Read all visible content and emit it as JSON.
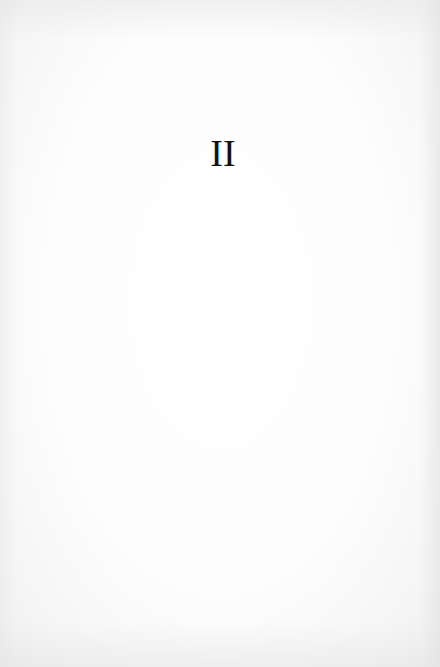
{
  "page": {
    "type": "book-part-title-page",
    "numeral": "II",
    "colors": {
      "paper": "#fdfdfd",
      "ink": "#111111"
    }
  }
}
